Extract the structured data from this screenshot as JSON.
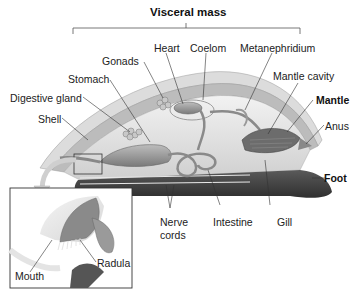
{
  "diagram": {
    "title": "Visceral mass",
    "labels": {
      "heart": "Heart",
      "coelom": "Coelom",
      "metanephridium": "Metanephridium",
      "gonads": "Gonads",
      "stomach": "Stomach",
      "mantle_cavity": "Mantle cavity",
      "mantle": "Mantle",
      "digestive_gland": "Digestive gland",
      "shell": "Shell",
      "anus": "Anus",
      "foot": "Foot",
      "nerve_cords": "Nerve cords",
      "nerve_cords_line1": "Nerve",
      "nerve_cords_line2": "cords",
      "intestine": "Intestine",
      "gill": "Gill",
      "mouth": "Mouth",
      "radula": "Radula"
    },
    "bold_labels": [
      "Visceral mass",
      "Mantle",
      "Foot"
    ],
    "colors": {
      "shell": "#d8d8d8",
      "mantle": "#9a9a9a",
      "foot": "#4a4a4a",
      "organs": "#8c8c8c",
      "text": "#222222",
      "leader_lines": "#333333"
    }
  }
}
